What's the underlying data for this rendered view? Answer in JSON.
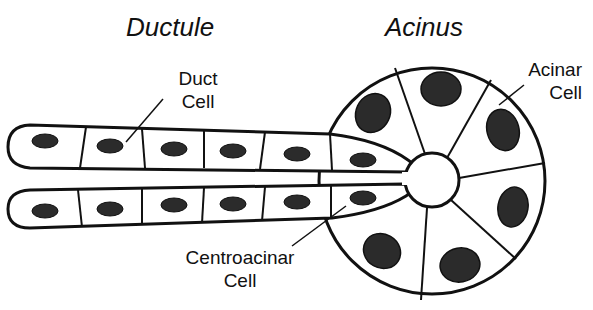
{
  "titles": {
    "ductule": "Ductule",
    "acinus": "Acinus"
  },
  "labels": {
    "duct_cell": {
      "line1": "Duct",
      "line2": "Cell"
    },
    "acinar_cell": {
      "line1": "Acinar",
      "line2": "Cell"
    },
    "centroacinar_cell": {
      "line1": "Centroacinar",
      "line2": "Cell"
    }
  },
  "colors": {
    "stroke": "#111111",
    "nucleus": "#2b2b2b",
    "background": "#ffffff"
  }
}
